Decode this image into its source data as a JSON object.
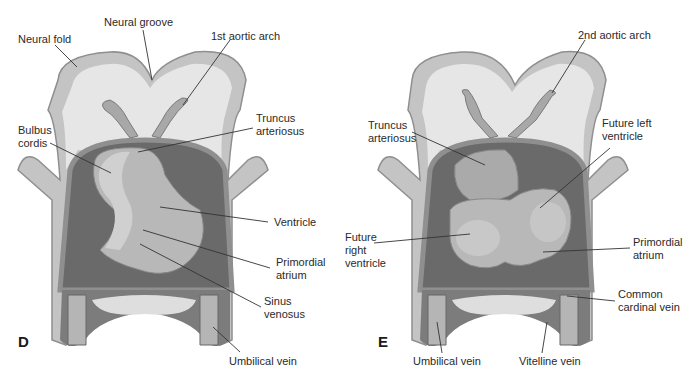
{
  "diagram": {
    "type": "anatomical-illustration",
    "colors": {
      "outer_tissue": "#c4c4c4",
      "inner_tissue": "#e6e6e6",
      "pericardium": "#8f8f8f",
      "cavity_dark": "#6a6a6a",
      "heart_light": "#b8b8b8",
      "heart_mid": "#a3a3a3",
      "vessel": "#9c9c9c",
      "line": "#333333"
    },
    "panels": [
      {
        "letter": "D",
        "labels": {
          "neural_fold": "Neural fold",
          "neural_groove": "Neural groove",
          "aortic_arch": "1st aortic arch",
          "truncus": "Truncus\narteriosus",
          "bulbus": "Bulbus\ncordis",
          "ventricle": "Ventricle",
          "primordial_atrium": "Primordial\natrium",
          "sinus_venosus": "Sinus\nvenosus",
          "umbilical_vein": "Umbilical vein"
        }
      },
      {
        "letter": "E",
        "labels": {
          "aortic_arch": "2nd aortic arch",
          "truncus": "Truncus\narteriosus",
          "future_left_ventricle": "Future left\nventricle",
          "future_right_ventricle": "Future\nright\nventricle",
          "primordial_atrium": "Primordial\natrium",
          "common_cardinal_vein": "Common\ncardinal vein",
          "umbilical_vein": "Umbilical vein",
          "vitelline_vein": "Vitelline vein"
        }
      }
    ]
  }
}
